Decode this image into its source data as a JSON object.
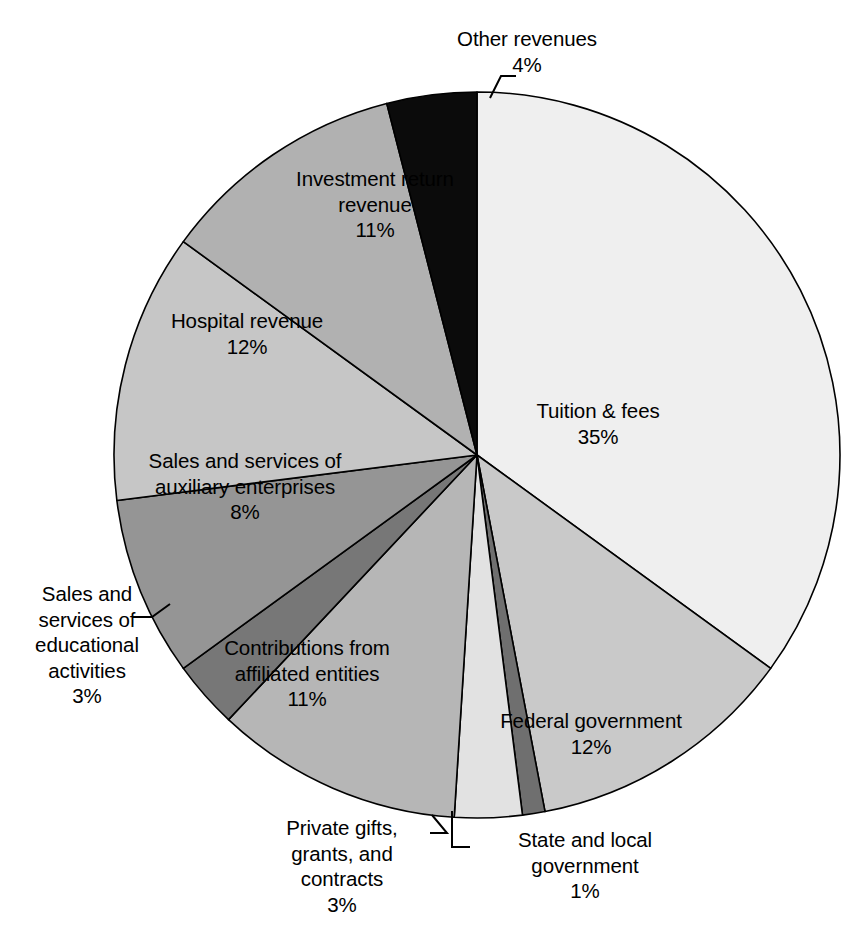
{
  "chart_data": {
    "type": "pie",
    "title": "",
    "subtitle": "",
    "xlabel": "",
    "ylabel": "",
    "legend_position": "none",
    "grid": false,
    "units": "percent",
    "start_angle_deg": 0,
    "direction": "clockwise",
    "categories": [
      "Tuition & fees",
      "Federal government",
      "State and local government",
      "Private gifts, grants, and contracts",
      "Contributions from affiliated entities",
      "Sales and services of educational activities",
      "Sales and services of auxiliary enterprises",
      "Hospital revenue",
      "Investment return revenue",
      "Other revenues"
    ],
    "values": [
      35,
      12,
      1,
      3,
      11,
      3,
      8,
      12,
      11,
      4
    ],
    "slices": [
      {
        "label": "Tuition & fees",
        "value": 35,
        "value_text": "35%",
        "color": "#efefef",
        "label_lines": [
          "Tuition & fees",
          "35%"
        ]
      },
      {
        "label": "Federal government",
        "value": 12,
        "value_text": "12%",
        "color": "#c9c9c9",
        "label_lines": [
          "Federal government",
          "12%"
        ]
      },
      {
        "label": "State and local government",
        "value": 1,
        "value_text": "1%",
        "color": "#6f6f6f",
        "label_lines": [
          "State and local",
          "government",
          "1%"
        ]
      },
      {
        "label": "Private gifts, grants, and contracts",
        "value": 3,
        "value_text": "3%",
        "color": "#e2e2e2",
        "label_lines": [
          "Private gifts,",
          "grants, and",
          "contracts",
          "3%"
        ]
      },
      {
        "label": "Contributions from affiliated entities",
        "value": 11,
        "value_text": "11%",
        "color": "#b6b6b6",
        "label_lines": [
          "Contributions from",
          "affiliated entities",
          "11%"
        ]
      },
      {
        "label": "Sales and services of educational activities",
        "value": 3,
        "value_text": "3%",
        "color": "#777777",
        "label_lines": [
          "Sales and",
          "services of",
          "educational",
          "activities",
          "3%"
        ]
      },
      {
        "label": "Sales and services of auxiliary enterprises",
        "value": 8,
        "value_text": "8%",
        "color": "#959595",
        "label_lines": [
          "Sales and services of",
          "auxiliary enterprises",
          "8%"
        ]
      },
      {
        "label": "Hospital revenue",
        "value": 12,
        "value_text": "12%",
        "color": "#c6c6c6",
        "label_lines": [
          "Hospital revenue",
          "12%"
        ]
      },
      {
        "label": "Investment return revenue",
        "value": 11,
        "value_text": "11%",
        "color": "#b1b1b1",
        "label_lines": [
          "Investment return",
          "revenue",
          "11%"
        ]
      },
      {
        "label": "Other revenues",
        "value": 4,
        "value_text": "4%",
        "color": "#0b0b0b",
        "label_lines": [
          "Other revenues",
          "4%"
        ]
      }
    ]
  },
  "labels": {
    "tuition": "Tuition & fees\n35%",
    "federal": "Federal government\n12%",
    "state": "State and local\ngovernment\n1%",
    "private": "Private gifts,\ngrants, and\ncontracts\n3%",
    "contrib": "Contributions from\naffiliated entities\n11%",
    "educational": "Sales and\nservices of\neducational\nactivities\n3%",
    "auxiliary": "Sales and services of\nauxiliary enterprises\n8%",
    "hospital": "Hospital revenue\n12%",
    "investment": "Investment return\nrevenue\n11%",
    "other": "Other revenues\n4%"
  },
  "style": {
    "background": "#ffffff",
    "outline": "#000000",
    "text": "#000000"
  }
}
